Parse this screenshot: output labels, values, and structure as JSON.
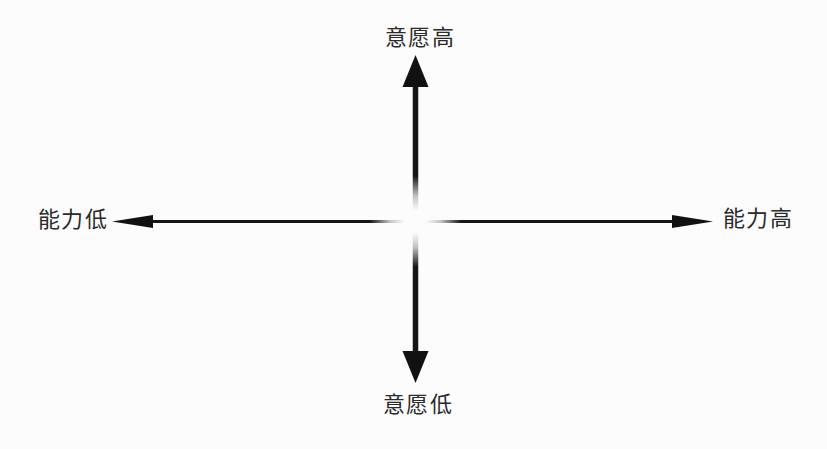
{
  "diagram": {
    "type": "quadrant-axes",
    "vertical_axis": {
      "top_label": "意愿高",
      "bottom_label": "意愿低"
    },
    "horizontal_axis": {
      "left_label": "能力低",
      "right_label": "能力高"
    }
  },
  "colors": {
    "background": "#fcfcfc",
    "axis": "#161616",
    "arrowhead": "#111111",
    "label_text": "#2a2a2a"
  }
}
